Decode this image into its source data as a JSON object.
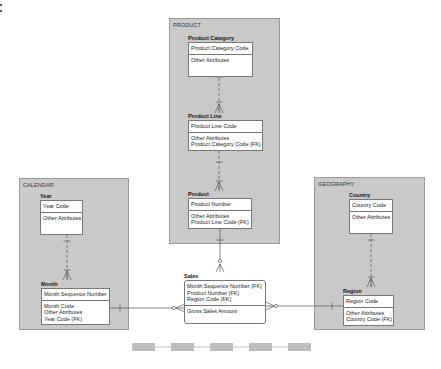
{
  "groups": {
    "product": {
      "label": "PRODUCT"
    },
    "calendar": {
      "label": "CALENDAR"
    },
    "geography": {
      "label": "GEOGRAPHY"
    }
  },
  "entities": {
    "product_category": {
      "title": "Product Category",
      "keys": [
        "Product Category Code"
      ],
      "attributes": [
        "Other Attributes"
      ]
    },
    "product_line": {
      "title": "Product Line",
      "keys": [
        "Product Line Code"
      ],
      "attributes": [
        "Other Attributes",
        "Product Category Code (FK)"
      ]
    },
    "product": {
      "title": "Product",
      "keys": [
        "Product Number"
      ],
      "attributes": [
        "Other Attributes",
        "Product Line Code (FK)"
      ]
    },
    "year": {
      "title": "Year",
      "keys": [
        "Year Code"
      ],
      "attributes": [
        "Other Attributes"
      ]
    },
    "month": {
      "title": "Month",
      "keys": [
        "Month Sequence Number"
      ],
      "attributes": [
        "Month Code",
        "Other Attributes",
        "Year Code (FK)"
      ]
    },
    "country": {
      "title": "Country",
      "keys": [
        "Country Code"
      ],
      "attributes": [
        "Other Attributes"
      ]
    },
    "region": {
      "title": "Region",
      "keys": [
        "Region Code"
      ],
      "attributes": [
        "Other Attributes",
        "Country Code (FK)"
      ]
    },
    "sales": {
      "title": "Sales",
      "keys": [
        "Month Sequence Number (FK)",
        "Product Number (FK)",
        "Region Code (FK)"
      ],
      "attributes": [
        "Gross Sales Amount"
      ]
    }
  },
  "relationships": [
    {
      "from": "Product Category",
      "to": "Product Line",
      "type": "identifying-optional",
      "cardinality": "one-to-many"
    },
    {
      "from": "Product Line",
      "to": "Product",
      "type": "non-identifying",
      "cardinality": "one-to-many"
    },
    {
      "from": "Year",
      "to": "Month",
      "type": "non-identifying",
      "cardinality": "one-to-many"
    },
    {
      "from": "Country",
      "to": "Region",
      "type": "non-identifying",
      "cardinality": "one-to-many"
    },
    {
      "from": "Product",
      "to": "Sales",
      "type": "identifying",
      "cardinality": "one-to-zero-or-many"
    },
    {
      "from": "Month",
      "to": "Sales",
      "type": "identifying",
      "cardinality": "one-to-zero-or-many"
    },
    {
      "from": "Region",
      "to": "Sales",
      "type": "identifying",
      "cardinality": "one-to-zero-or-many"
    }
  ],
  "pager": {
    "count": 5
  },
  "colors": {
    "group_fill": "#c9c9c9",
    "group_border": "#9a9a9a",
    "line": "#666666",
    "pager": "#bdbdbd"
  }
}
